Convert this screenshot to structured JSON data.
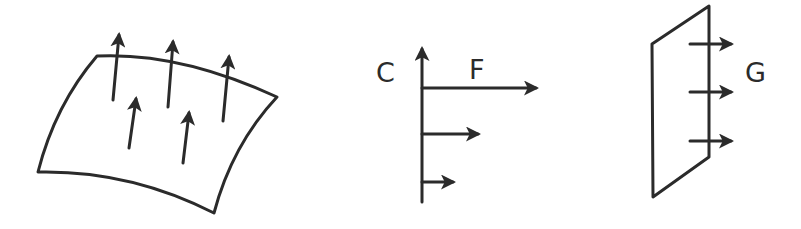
{
  "diagram": {
    "panels": [
      {
        "id": "surface",
        "description": "Curved surface patch with five upward vector arrows",
        "arrow_count": 5
      },
      {
        "id": "velocity-profile",
        "description": "Vertical axis with three horizontal arrows of decreasing length",
        "labels": {
          "axis": "C",
          "arrow": "F"
        },
        "arrow_count": 3
      },
      {
        "id": "plane",
        "description": "Parallelogram plane pierced by three horizontal arrows",
        "labels": {
          "arrows": "G"
        },
        "arrow_count": 3
      }
    ],
    "colors": {
      "stroke": "#2b2b2b",
      "background": "#ffffff"
    }
  }
}
